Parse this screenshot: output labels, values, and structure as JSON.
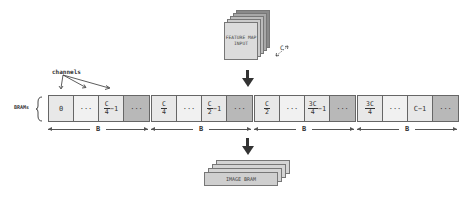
{
  "feature_map": {
    "label_line1": "FEATURE MAP",
    "label_line2": "INPUT",
    "depth_label": "C"
  },
  "channels_label": "channels",
  "brams_label": "BRAMs",
  "groups": [
    {
      "cells": [
        {
          "type": "text",
          "value": "0"
        },
        {
          "type": "text",
          "value": "···"
        },
        {
          "type": "frac",
          "num": "C",
          "den": "4",
          "suffix": "−1"
        },
        {
          "type": "text",
          "value": "···"
        }
      ],
      "width_label": "B"
    },
    {
      "cells": [
        {
          "type": "frac",
          "num": "C",
          "den": "4",
          "suffix": ""
        },
        {
          "type": "text",
          "value": "···"
        },
        {
          "type": "frac",
          "num": "C",
          "den": "2",
          "suffix": "−1"
        },
        {
          "type": "text",
          "value": "···"
        }
      ],
      "width_label": "B"
    },
    {
      "cells": [
        {
          "type": "frac",
          "num": "C",
          "den": "2",
          "suffix": ""
        },
        {
          "type": "text",
          "value": "···"
        },
        {
          "type": "frac",
          "num": "3C",
          "den": "4",
          "suffix": "−1"
        },
        {
          "type": "text",
          "value": "···"
        }
      ],
      "width_label": "B"
    },
    {
      "cells": [
        {
          "type": "frac",
          "num": "3C",
          "den": "4",
          "suffix": ""
        },
        {
          "type": "text",
          "value": "···"
        },
        {
          "type": "text",
          "value": "C−1"
        },
        {
          "type": "text",
          "value": "···"
        }
      ],
      "width_label": "B"
    }
  ],
  "image_bram": {
    "label": "IMAGE BRAM"
  },
  "colors": {
    "cell": "#e8e8e8",
    "cell_padding": "#b8b8b8",
    "arrow": "#333333"
  }
}
